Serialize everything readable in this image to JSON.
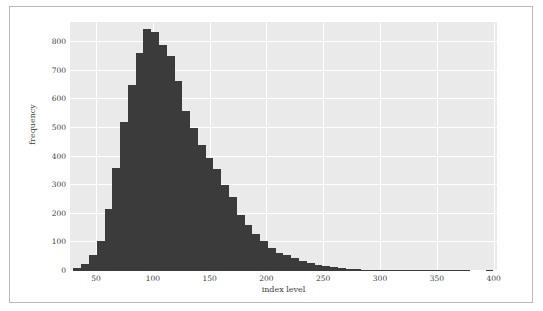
{
  "figure": {
    "background": "#ffffff",
    "border_color": "#b9b9b9",
    "plot_background": "#eaeaea",
    "grid_color": "#ffffff",
    "bar_color": "#3b3b3b",
    "tick_color": "#3c3c3c"
  },
  "chart_data": {
    "type": "bar",
    "subtype": "histogram",
    "title": "",
    "xlabel": "index level",
    "ylabel": "frequency",
    "xlim": [
      27,
      403
    ],
    "ylim": [
      0,
      870
    ],
    "xticks": [
      50,
      100,
      150,
      200,
      250,
      300,
      350,
      400
    ],
    "xtick_labels": [
      "50",
      "100",
      "150",
      "200",
      "250",
      "300",
      "350",
      "400"
    ],
    "yticks": [
      0,
      100,
      200,
      300,
      400,
      500,
      600,
      700,
      800
    ],
    "ytick_labels": [
      "0",
      "100",
      "200",
      "300",
      "400",
      "500",
      "600",
      "700",
      "800"
    ],
    "grid": true,
    "grid_axis": "both",
    "legend": null,
    "bin_width": 6.85,
    "bin_starts": [
      30.0,
      36.85,
      43.7,
      50.55,
      57.4,
      64.25,
      71.1,
      77.95,
      84.8,
      91.65,
      98.5,
      105.35,
      112.2,
      119.05,
      125.9,
      132.75,
      139.6,
      146.45,
      153.3,
      160.15,
      167.0,
      173.85,
      180.7,
      187.55,
      194.4,
      201.25,
      208.1,
      214.95,
      221.8,
      228.65,
      235.5,
      242.35,
      249.2,
      256.05,
      262.9,
      269.75,
      276.6,
      283.45,
      290.3,
      297.15,
      304.0,
      310.85,
      317.7,
      324.55,
      331.4,
      338.25,
      345.1,
      351.95,
      358.8,
      365.65,
      372.5,
      379.35,
      386.2,
      393.05
    ],
    "bin_centers": [
      33.4,
      40.3,
      47.1,
      54.0,
      60.8,
      67.7,
      74.5,
      81.4,
      88.2,
      95.1,
      101.9,
      108.8,
      115.6,
      122.5,
      129.3,
      136.2,
      143.0,
      149.9,
      156.7,
      163.6,
      170.4,
      177.3,
      184.1,
      191.0,
      197.8,
      204.7,
      211.5,
      218.4,
      225.2,
      232.1,
      238.9,
      245.8,
      252.6,
      259.5,
      266.3,
      273.2,
      280.0,
      286.9,
      293.7,
      300.6,
      307.4,
      314.3,
      321.1,
      328.0,
      334.8,
      341.7,
      348.5,
      355.4,
      362.2,
      369.1,
      375.9,
      382.8,
      389.6,
      396.5
    ],
    "values": [
      10,
      25,
      55,
      105,
      215,
      360,
      520,
      650,
      760,
      845,
      835,
      790,
      750,
      665,
      560,
      500,
      440,
      395,
      355,
      300,
      260,
      195,
      160,
      130,
      105,
      80,
      62,
      55,
      44,
      36,
      28,
      22,
      18,
      14,
      10,
      7,
      6,
      5,
      4,
      4,
      3,
      3,
      2,
      2,
      1,
      1,
      1,
      1,
      1,
      1,
      1,
      0,
      0,
      1
    ],
    "peak_value": 845,
    "peak_bin_center": 95.1
  }
}
